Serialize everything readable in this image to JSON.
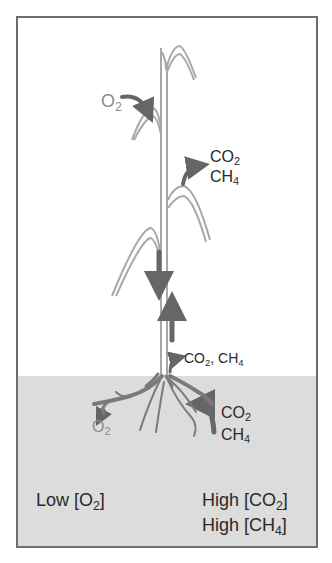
{
  "diagram": {
    "regions": {
      "air": {
        "color": "#ffffff"
      },
      "soil": {
        "color": "#dcdcdc"
      }
    },
    "colors": {
      "plant": "#a0a0a0",
      "arrow": "#666666",
      "frame": "#6e6e6e",
      "text_dark": "#2a2a2a",
      "text_light": "#8c8c8c"
    },
    "labels": {
      "o2_leaf": {
        "base": "O",
        "sub": "2"
      },
      "leaf_emission": {
        "line1": {
          "base": "CO",
          "sub": "2"
        },
        "line2": {
          "base": "CH",
          "sub": "4"
        }
      },
      "stem_base_emission": {
        "part1": "CO",
        "sub1": "2",
        "sep": ", CH",
        "sub2": "4"
      },
      "soil_uptake": {
        "line1": {
          "base": "CO",
          "sub": "2"
        },
        "line2": {
          "base": "CH",
          "sub": "4"
        }
      },
      "root_o2_release": {
        "base": "O",
        "sub": "2"
      },
      "low_o2": {
        "pre": "Low [O",
        "sub": "2",
        "post": "]"
      },
      "high_co2": {
        "pre": "High [CO",
        "sub": "2",
        "post": "]"
      },
      "high_ch4": {
        "pre": "High [CH",
        "sub": "4",
        "post": "]"
      }
    }
  }
}
